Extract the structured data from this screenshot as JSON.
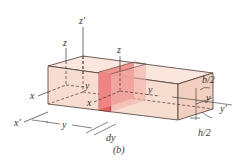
{
  "figure": {
    "caption": "(b)",
    "labels": {
      "z_prime": "z′",
      "z_left": "z",
      "z_slice": "z",
      "x_left": "x",
      "x_prime": "x′",
      "x_slice": "x",
      "y_left_inner": "y",
      "y_slice": "y",
      "y_right": "y",
      "y_prime": "y′",
      "y_dimension": "y",
      "dy": "dy",
      "b_half": "b/2",
      "h_half": "h/2"
    },
    "colors": {
      "block_fill": "#f7ddd0",
      "block_top": "#fae6dc",
      "block_side": "#f3cfbf",
      "slice_front": "#e8585a",
      "slice_side": "#f08a86",
      "slice_top": "#f4b0a8",
      "edge": "#4a3a36",
      "axis": "#333333"
    }
  }
}
